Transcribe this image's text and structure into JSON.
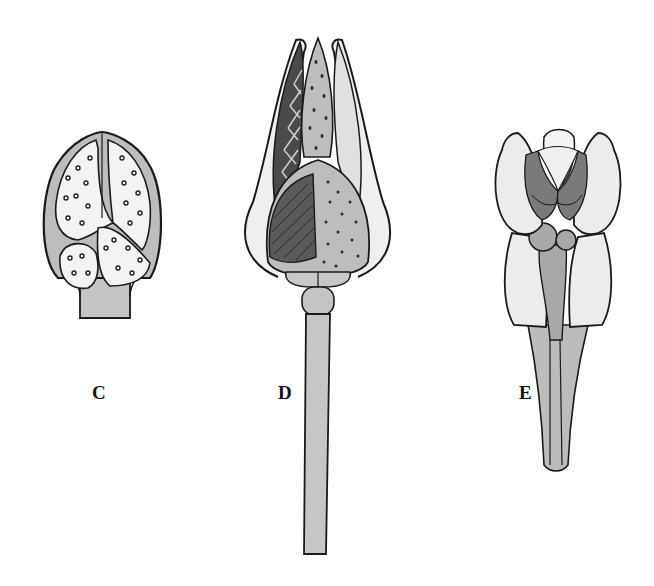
{
  "figure": {
    "panels": [
      {
        "id": "C",
        "label": "C",
        "description": "bud-shaped organ in cross-section showing two speckled lobes and lower chamber"
      },
      {
        "id": "D",
        "label": "D",
        "description": "elongated bud with sepals, dotted central column, hatched and dotted lobes, long stalk"
      },
      {
        "id": "E",
        "label": "E",
        "description": "flower bud with rounded lobes, dark inner structures and tapering stalk"
      }
    ]
  },
  "colors": {
    "ink": "#1a1a1a",
    "gray_fill": "#bdbdbd",
    "light_fill": "#e8e8e8",
    "dark_fill": "#6e6e6e",
    "background": "#ffffff"
  }
}
